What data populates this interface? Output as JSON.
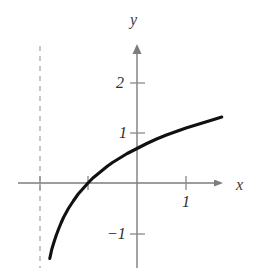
{
  "figure": {
    "title": "",
    "background_color": "#ffffff",
    "axis_color": "#808080",
    "curve_color": "#111111",
    "asymptote_color": "#b9b9b9",
    "axis_labels": {
      "x": "x",
      "y": "y"
    },
    "tick_labels": {
      "y_two": "2",
      "y_one": "1",
      "y_minus_one": "−1",
      "x_one": "1"
    }
  },
  "chart_data": {
    "type": "line",
    "title": "",
    "xlabel": "x",
    "ylabel": "y",
    "xlim": [
      -2.45,
      1.75
    ],
    "ylim": [
      -1.75,
      2.8
    ],
    "grid": false,
    "legend": null,
    "xticks": [
      1
    ],
    "xtick_labels": [
      "1"
    ],
    "yticks": [
      -1,
      1,
      2
    ],
    "ytick_labels": [
      "−1",
      "1",
      "2"
    ],
    "annotations": [
      {
        "kind": "vertical-asymptote",
        "style": "dashed",
        "x": -2.0,
        "color": "#b9b9b9"
      }
    ],
    "series": [
      {
        "name": "y = ln(x + 2)",
        "color": "#111111",
        "x": [
          -1.78,
          -1.74,
          -1.7,
          -1.65,
          -1.6,
          -1.55,
          -1.5,
          -1.4,
          -1.3,
          -1.2,
          -1.1,
          -1.0,
          -0.9,
          -0.8,
          -0.7,
          -0.6,
          -0.5,
          -0.4,
          -0.3,
          -0.2,
          -0.1,
          0.0,
          0.2,
          0.4,
          0.6,
          0.8,
          1.0,
          1.2,
          1.4,
          1.6,
          1.73
        ],
        "y": [
          -1.51,
          -1.33,
          -1.2,
          -1.05,
          -0.92,
          -0.8,
          -0.69,
          -0.51,
          -0.36,
          -0.22,
          -0.11,
          0.0,
          0.1,
          0.18,
          0.26,
          0.34,
          0.41,
          0.47,
          0.53,
          0.59,
          0.64,
          0.69,
          0.79,
          0.88,
          0.96,
          1.03,
          1.1,
          1.16,
          1.22,
          1.28,
          1.32
        ]
      }
    ]
  },
  "geometry": {
    "origin_px": {
      "x": 137,
      "y": 183
    },
    "unit_px": {
      "x": 49,
      "y": 50
    },
    "x_axis": {
      "x_start": 18,
      "x_end": 222,
      "y": 183
    },
    "y_axis": {
      "x": 137,
      "y_start": 45,
      "y_end": 268
    },
    "asymptote": {
      "x": 40,
      "y_start": 46,
      "y_end": 268
    }
  }
}
